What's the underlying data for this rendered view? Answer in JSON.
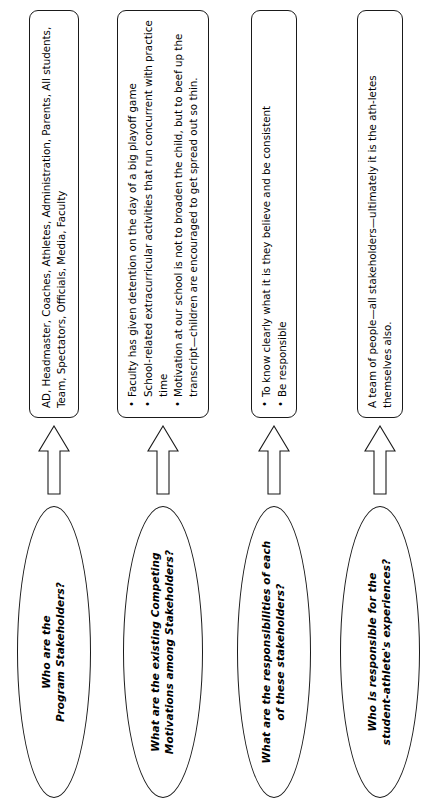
{
  "diagram": {
    "orientation": "rotated-90-ccw",
    "line_color": "#1a1a1a",
    "background_color": "#ffffff",
    "rows": [
      {
        "question": "Who are the\nProgram Stakeholders?",
        "arrow": "block-arrow-right",
        "answer_type": "paragraph",
        "answer": "AD, Headmaster, Coaches, Athletes, Administration, Parents, All students, Team, Spectators, Officials, Media, Faculty"
      },
      {
        "question": "What are the existing Competing\nMotivations among Stakeholders?",
        "arrow": "block-arrow-right",
        "answer_type": "bullets",
        "bullets": [
          "Faculty has given detention on the day of a big playoff game",
          "School-related extracurricular activities that run concurrent with practice time",
          "Motivation at our school is not to broaden the child, but to beef up the transcript—children are encouraged to get spread out so thin."
        ]
      },
      {
        "question": "What are the responsibilities of each\nof these stakeholders?",
        "arrow": "block-arrow-right",
        "answer_type": "bullets",
        "bullets": [
          "To know clearly what it is they believe and be consistent",
          "Be responsible"
        ]
      },
      {
        "question": "Who is responsible for the\nstudent-athlete's experiences?",
        "arrow": "block-arrow-right",
        "answer_type": "paragraph",
        "answer": "A team of people—all stakeholders—ultimately it is the ath-letes themselves also."
      }
    ]
  }
}
